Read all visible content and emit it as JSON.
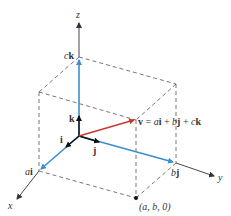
{
  "diagram": {
    "colors": {
      "axis": "#333333",
      "dashed": "#555555",
      "component": "#3a8fd0",
      "vector": "#c8362e",
      "unit": "#111111"
    },
    "axes": {
      "x_label": "x",
      "y_label": "y",
      "z_label": "z"
    },
    "unit_vectors": {
      "i_label": "i",
      "j_label": "j",
      "k_label": "k"
    },
    "components": {
      "ai_prefix": "a",
      "ai_suffix": "i",
      "bj_prefix": "b",
      "bj_suffix": "j",
      "ck_prefix": "c",
      "ck_suffix": "k"
    },
    "vector": {
      "name": "v",
      "equation_parts": [
        "v",
        " = ",
        "a",
        "i",
        " + ",
        "b",
        "j",
        " + ",
        "c",
        "k"
      ]
    },
    "point": {
      "label": "(a, b, 0)"
    }
  }
}
